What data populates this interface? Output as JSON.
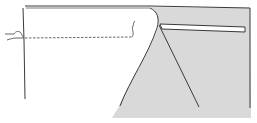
{
  "figure": {
    "title": "Sewing diagram: fabric panel folded over with welt strip and stitch line",
    "colors": {
      "background": "#ffffff",
      "fabric_shade": "#d9d9d9",
      "outline": "#3a3a3a",
      "strip": "#ffffff"
    }
  }
}
